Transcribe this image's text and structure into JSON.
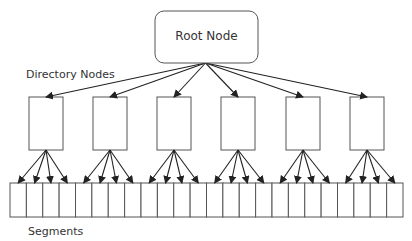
{
  "root": {
    "label": "Root Node",
    "x": 155,
    "y": 11,
    "w": 103,
    "h": 52,
    "radius": 9
  },
  "labels": {
    "directory": {
      "text": "Directory Nodes",
      "x": 26,
      "y": 68
    },
    "segments": {
      "text": "Segments",
      "x": 28,
      "y": 225
    }
  },
  "directory_nodes": {
    "count": 6,
    "x": [
      29,
      93,
      157,
      221,
      286,
      350
    ],
    "y": 97,
    "w": 34,
    "h": 53
  },
  "segments": {
    "count": 24,
    "x0": 10,
    "x1": 403,
    "y": 183,
    "h": 34,
    "per_directory": 4
  },
  "colors": {
    "stroke": "#555555",
    "arrow": "#222222",
    "text": "#333333"
  }
}
